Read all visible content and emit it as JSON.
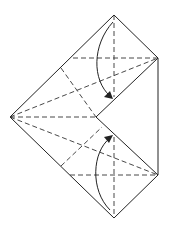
{
  "diagram": {
    "type": "origami-fold-step",
    "colors": {
      "line": "#222222",
      "background": "#ffffff"
    },
    "outline_points": [
      [
        114,
        15
      ],
      [
        158,
        58
      ],
      [
        158,
        175
      ],
      [
        114,
        218
      ],
      [
        10,
        117
      ]
    ],
    "notch_point": [
      96,
      117
    ],
    "arrows": [
      {
        "name": "top-fold-arrow",
        "from": [
          114,
          22
        ],
        "to": [
          112,
          98
        ],
        "direction": "down"
      },
      {
        "name": "bottom-fold-arrow",
        "from": [
          114,
          212
        ],
        "to": [
          112,
          136
        ],
        "direction": "up"
      }
    ]
  }
}
